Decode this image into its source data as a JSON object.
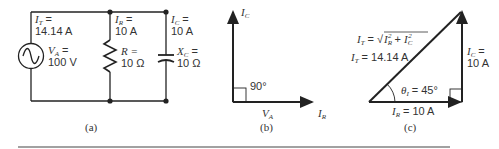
{
  "figure": {
    "panels": [
      {
        "id": "a",
        "caption": "(a)",
        "source": {
          "label_total_current": "I",
          "sub_total": "T",
          "total_current_eq": "=",
          "total_current_value": "14.14 A",
          "label_voltage": "V",
          "sub_voltage": "A",
          "voltage_eq": "=",
          "voltage_value": "100 V"
        },
        "resistor_branch": {
          "current_label": "I",
          "current_sub": "R",
          "current_eq": "=",
          "current_value": "10 A",
          "component_label": "R =",
          "component_value": "10 Ω"
        },
        "capacitor_branch": {
          "current_label": "I",
          "current_sub": "C",
          "current_eq": "=",
          "current_value": "10 A",
          "component_label": "X",
          "component_sub": "C",
          "component_eq": "=",
          "component_value": "10 Ω"
        }
      },
      {
        "id": "b",
        "caption": "(b)",
        "vertical_axis": {
          "label": "I",
          "sub": "C"
        },
        "horizontal_axis": {
          "label": "I",
          "sub": "R"
        },
        "reference": {
          "label": "V",
          "sub": "A"
        },
        "angle": "90°"
      },
      {
        "id": "c",
        "caption": "(c)",
        "formula": {
          "lhs": "I",
          "lhs_sub": "T",
          "eq": "= √",
          "t1": "I",
          "t1_sub": "R",
          "plus": "+",
          "t2": "I",
          "t2_sub": "C",
          "sq": "2"
        },
        "hypotenuse": {
          "label": "I",
          "sub": "T",
          "value": "= 14.14 A"
        },
        "vertical": {
          "label": "I",
          "sub": "C",
          "eq": "=",
          "value": "10 A"
        },
        "base": {
          "label": "I",
          "sub": "R",
          "value": "= 10 A"
        },
        "angle": {
          "label": "θ",
          "sub": "I",
          "value": "= 45°"
        }
      }
    ]
  }
}
